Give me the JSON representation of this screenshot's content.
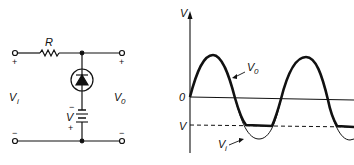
{
  "circuit": {
    "resistor_label": "R",
    "input_label": "V",
    "input_sub": "i",
    "output_label": "V",
    "output_sub": "0",
    "battery_label": "V",
    "input_plus": "+",
    "input_minus": "−",
    "output_plus": "+",
    "output_minus": "−",
    "battery_minus": "−",
    "battery_plus": "+"
  },
  "graph": {
    "y_axis_label": "V",
    "zero_label": "0",
    "level_label": "V",
    "curve_output_label": "V",
    "curve_output_sub": "0",
    "curve_input_label": "V",
    "curve_input_sub": "i"
  },
  "colors": {
    "ink": "#111111",
    "background": "#ffffff"
  }
}
